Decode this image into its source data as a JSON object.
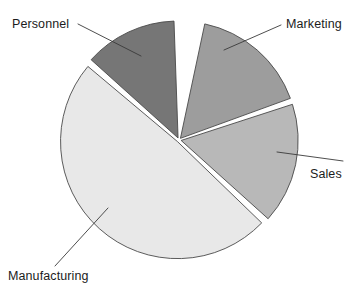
{
  "chart_data": {
    "type": "pie",
    "title": "",
    "categories": [
      "Marketing",
      "Sales",
      "Manufacturing",
      "Personnel"
    ],
    "values": [
      16,
      17,
      49,
      13
    ],
    "unit": "percent",
    "legend_position": "none",
    "labels_style": "callout-with-leader-line",
    "exploded": true,
    "start_angle_deg": 0,
    "direction": "clockwise",
    "colors": [
      "#9d9d9d",
      "#b8b8b8",
      "#e8e8e8",
      "#767676"
    ],
    "slices": [
      {
        "name": "Marketing",
        "value": 16,
        "color": "#9d9d9d",
        "start_deg": 12,
        "end_deg": 70,
        "label": "Marketing"
      },
      {
        "name": "Sales",
        "value": 17,
        "color": "#b8b8b8",
        "start_deg": 72,
        "end_deg": 132,
        "label": "Sales"
      },
      {
        "name": "Manufacturing",
        "value": 49,
        "color": "#e8e8e8",
        "start_deg": 134,
        "end_deg": 310,
        "label": "Manufacturing"
      },
      {
        "name": "Personnel",
        "value": 13,
        "color": "#767676",
        "start_deg": 312,
        "end_deg": 358,
        "label": "Personnel"
      }
    ],
    "xlabel": "",
    "ylabel": ""
  },
  "labels": {
    "personnel": "Personnel",
    "marketing": "Marketing",
    "sales": "Sales",
    "manufacturing": "Manufacturing"
  },
  "geometry": {
    "center_x": 179,
    "center_y": 140,
    "radius": 117,
    "explode_gap": 2.2
  },
  "style": {
    "background": "#ffffff",
    "outline_color": "#4a4a4a",
    "leader_color": "#3a3a3a",
    "text_color": "#1c1c1c"
  }
}
